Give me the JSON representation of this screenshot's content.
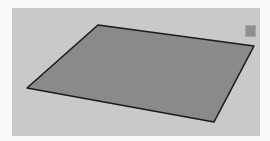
{
  "viewport": {
    "background_color": "#c9c9c9",
    "plane": {
      "fill_color": "#8a8a8a",
      "edge_color": "#1a1a1a",
      "vertices": [
        [
          86,
          17
        ],
        [
          242,
          38
        ],
        [
          202,
          114
        ],
        [
          15,
          80
        ]
      ]
    },
    "corner_swatch": {
      "color": "#8f8f8f"
    }
  }
}
